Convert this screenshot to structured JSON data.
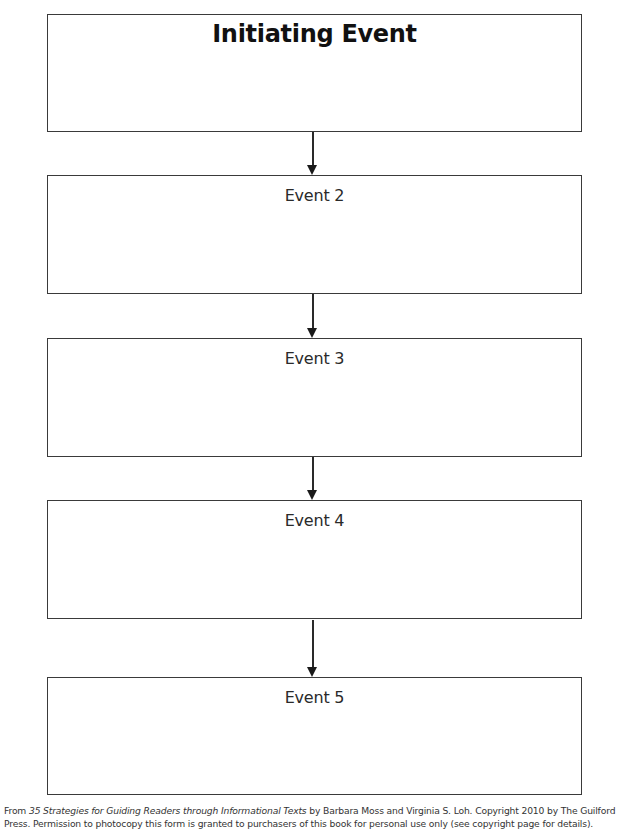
{
  "diagram": {
    "type": "flowchart",
    "direction": "top-to-bottom",
    "boxes": [
      {
        "id": "initiating",
        "label": "Initiating Event",
        "emphasis": "bold"
      },
      {
        "id": "event2",
        "label": "Event 2"
      },
      {
        "id": "event3",
        "label": "Event 3"
      },
      {
        "id": "event4",
        "label": "Event 4"
      },
      {
        "id": "event5",
        "label": "Event 5"
      }
    ],
    "arrows": [
      {
        "from": "initiating",
        "to": "event2"
      },
      {
        "from": "event2",
        "to": "event3"
      },
      {
        "from": "event3",
        "to": "event4"
      },
      {
        "from": "event4",
        "to": "event5"
      }
    ],
    "colors": {
      "border": "#3a3a3a",
      "arrow": "#1a1a1a",
      "background": "#ffffff",
      "text": "#1a1a1a"
    }
  },
  "footer": {
    "prefix": "From ",
    "book_title": "35 Strategies for Guiding Readers through Informational Texts",
    "suffix": " by Barbara Moss and Virginia S. Loh. Copyright 2010 by The Guilford Press. Permission to photocopy this form is granted to purchasers of this book for personal use only (see copyright page for details)."
  }
}
